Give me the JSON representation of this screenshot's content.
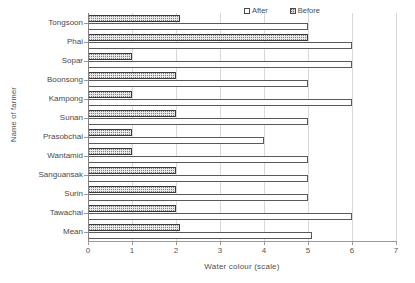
{
  "chart_data": {
    "type": "bar",
    "orientation": "horizontal",
    "title": "",
    "xlabel": "Water colour (scale)",
    "ylabel": "Name of farmer",
    "xlim": [
      0,
      7
    ],
    "xticks": [
      0,
      1,
      2,
      3,
      4,
      5,
      6,
      7
    ],
    "grid": true,
    "legend_position": "top-right",
    "categories": [
      "Tongsoon",
      "Phai",
      "Sopar",
      "Boonsong",
      "Kampong",
      "Sunan",
      "Prasobchai",
      "Wantamid",
      "Sanguansak",
      "Surin",
      "Tawachai",
      "Mean"
    ],
    "series": [
      {
        "name": "After",
        "style": "white",
        "values": [
          5.0,
          6.0,
          6.0,
          5.0,
          6.0,
          5.0,
          4.0,
          5.0,
          5.0,
          5.0,
          6.0,
          5.1
        ]
      },
      {
        "name": "Before",
        "style": "dotted-pattern",
        "values": [
          2.1,
          5.0,
          1.0,
          2.0,
          1.0,
          2.0,
          1.0,
          1.0,
          2.0,
          2.0,
          2.0,
          2.1
        ]
      }
    ]
  },
  "legend": {
    "entries": [
      {
        "label": "After",
        "swatch": "white-square-icon"
      },
      {
        "label": "Before",
        "swatch": "patterned-square-icon"
      }
    ]
  },
  "colors": {
    "axis": "#9a9a9a",
    "grid": "#d9d9d9",
    "bar_after_fill": "#ffffff",
    "bar_after_edge": "#595959",
    "bar_before_fill": "#e8e8e8",
    "bar_before_edge": "#3a3a3a",
    "text": "#4a4a4a",
    "background": "#ffffff"
  }
}
